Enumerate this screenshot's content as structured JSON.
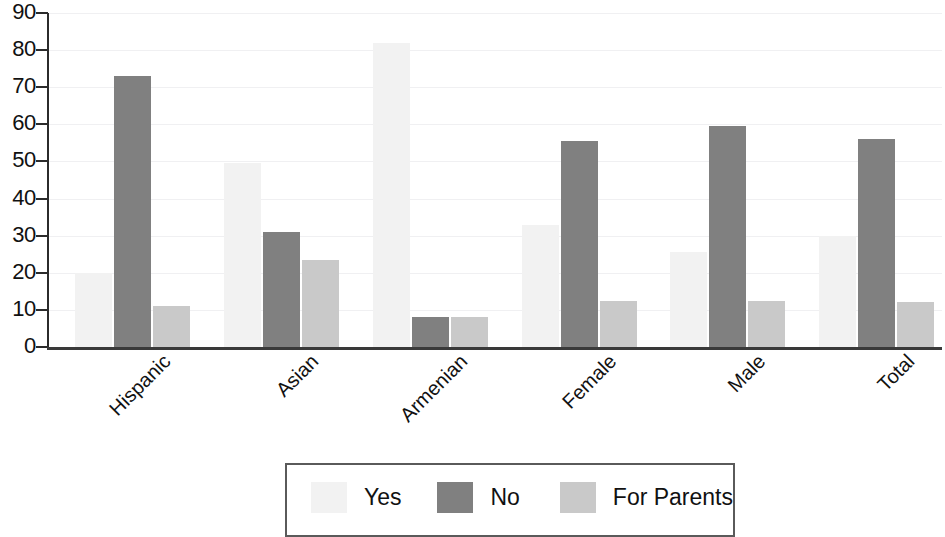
{
  "chart_data": {
    "type": "bar",
    "title": "",
    "subtitle": "",
    "xlabel": "",
    "ylabel": "",
    "ylim": [
      0,
      90
    ],
    "y_ticks": [
      0,
      10,
      20,
      30,
      40,
      50,
      60,
      70,
      80,
      90
    ],
    "grid": true,
    "legend_position": "bottom",
    "categories": [
      "Hispanic",
      "Asian",
      "Armenian",
      "Female",
      "Male",
      "Total"
    ],
    "series": [
      {
        "name": "Yes",
        "color": "#f2f2f2",
        "values": [
          20,
          49.5,
          82,
          33,
          25.5,
          30
        ]
      },
      {
        "name": "No",
        "color": "#808080",
        "values": [
          73,
          31,
          8,
          55.5,
          59.5,
          56
        ]
      },
      {
        "name": "For Parents",
        "color": "#c9c9c9",
        "values": [
          11,
          23.5,
          8,
          12.5,
          12.5,
          12
        ]
      }
    ]
  },
  "axis": {
    "y_tick_labels": [
      "90",
      "80",
      "70",
      "60",
      "50",
      "40",
      "30",
      "20",
      "10",
      "0"
    ]
  },
  "legend": {
    "entries": [
      {
        "label": "Yes",
        "swatch": "legend-swatch-yes"
      },
      {
        "label": "No",
        "swatch": "legend-swatch-no"
      },
      {
        "label": "For Parents",
        "swatch": "legend-swatch-for-parents"
      }
    ]
  },
  "colors": {
    "yes": "#f2f2f2",
    "no": "#808080",
    "for_parents": "#c9c9c9",
    "axis": "#2b2b2b",
    "gridline": "#f0f0f2",
    "legend_border": "#5a5a5a",
    "text": "#111111"
  }
}
